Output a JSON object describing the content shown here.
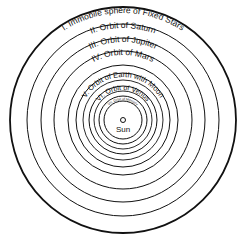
{
  "diagram": {
    "center": {
      "x": 123,
      "y": 120
    },
    "colors": {
      "line": "#111111",
      "background": "#ffffff"
    },
    "spheres": [
      {
        "numeral": "I.",
        "label": "I.  Immobile sphere of Fixed Stars",
        "radius": 113,
        "stroke": 1.8
      },
      {
        "numeral": "II.",
        "label": "II.  Orbit of Saturn",
        "radius": 96,
        "stroke": 1.0
      },
      {
        "numeral": "III.",
        "label": "III.  Orbit of Jupiter",
        "radius": 82,
        "stroke": 1.0
      },
      {
        "numeral": "IV.",
        "label": "IV. Orbit of Mars",
        "radius": 69,
        "stroke": 1.0
      },
      {
        "numeral": "V.",
        "label": "V. Orbit of Earth with Moon",
        "radius": 47,
        "stroke": 1.0
      },
      {
        "numeral": "VI.",
        "label": "VI. Orbit of Venus",
        "radius": 34,
        "stroke": 1.0
      },
      {
        "numeral": "VII.",
        "label": "VII. Orbit of Mercury",
        "radius": 24,
        "stroke": 1.0
      }
    ],
    "moon_orbit": {
      "radius": 40,
      "stroke": 0.9
    },
    "extra_rings": [
      {
        "radius": 55,
        "stroke": 1.0
      },
      {
        "radius": 29,
        "stroke": 0.9
      },
      {
        "radius": 19,
        "stroke": 1.0
      }
    ],
    "sun": {
      "label": "Sun",
      "radius": 2.5
    }
  }
}
